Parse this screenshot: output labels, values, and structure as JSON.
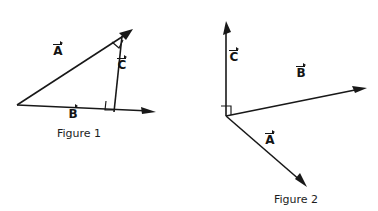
{
  "document": {
    "title": "Vector Diagrams",
    "background_color": "#ffffff",
    "ink_color": "#181818"
  },
  "figures": [
    {
      "id": "figure-1",
      "caption": "Figure 1",
      "description": "Right triangle formed by vectors A, B and C with two right angle marks",
      "vectors": [
        {
          "name": "A",
          "label": "A",
          "from": [
            17,
            105
          ],
          "to": [
            132,
            30
          ]
        },
        {
          "name": "B",
          "label": "B",
          "from": [
            17,
            105
          ],
          "to": [
            155,
            112
          ]
        },
        {
          "name": "C",
          "label": "C",
          "from": [
            122,
            36
          ],
          "to": [
            114,
            112
          ]
        }
      ],
      "right_angles": [
        {
          "name": "angle-A-C",
          "at": [
            120,
            41
          ]
        },
        {
          "name": "angle-C-B",
          "at": [
            113,
            106
          ]
        }
      ],
      "labels": [
        {
          "name": "vector-a-label",
          "text": "A",
          "x": 57,
          "y": 48
        },
        {
          "name": "vector-b-label",
          "text": "B",
          "x": 72,
          "y": 104
        },
        {
          "name": "vector-c-label",
          "text": "C",
          "x": 120,
          "y": 62
        }
      ],
      "caption_position": {
        "x": 59,
        "y": 128
      }
    },
    {
      "id": "figure-2",
      "caption": "Figure 2",
      "description": "Three vectors A, B and C radiating from a common origin with one right angle mark",
      "vectors": [
        {
          "name": "C",
          "label": "C",
          "from": [
            226,
            116
          ],
          "to": [
            226,
            22
          ]
        },
        {
          "name": "B",
          "label": "B",
          "from": [
            226,
            116
          ],
          "to": [
            366,
            88
          ]
        },
        {
          "name": "A",
          "label": "A",
          "from": [
            226,
            116
          ],
          "to": [
            306,
            186
          ]
        }
      ],
      "right_angles": [
        {
          "name": "angle-C-B",
          "at": [
            227,
            108
          ]
        }
      ],
      "labels": [
        {
          "name": "vector-c-label",
          "text": "C",
          "x": 230,
          "y": 54
        },
        {
          "name": "vector-b-label",
          "text": "B",
          "x": 299,
          "y": 70
        },
        {
          "name": "vector-a-label",
          "text": "A",
          "x": 268,
          "y": 137
        }
      ],
      "caption_position": {
        "x": 277,
        "y": 194
      }
    }
  ]
}
